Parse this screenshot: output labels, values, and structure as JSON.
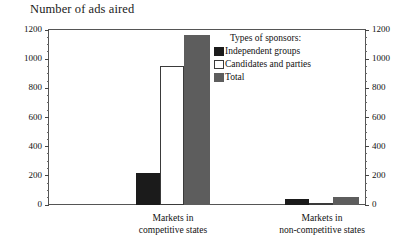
{
  "chart_data": {
    "type": "bar",
    "title": "Number of ads aired",
    "xlabel": "",
    "ylabel": "",
    "ylim": [
      0,
      1200
    ],
    "ytick_step": 200,
    "yticks": [
      0,
      200,
      400,
      600,
      800,
      1000,
      1200
    ],
    "ytick_labels": [
      "0",
      "200",
      "400",
      "600",
      "800",
      "1000",
      "1200"
    ],
    "secondary_axis": {
      "position": "right",
      "ylim": [
        0,
        1200
      ],
      "ytick_labels": [
        "0",
        "200",
        "400",
        "600",
        "800",
        "1000",
        "1200"
      ]
    },
    "grid": false,
    "legend_position": "inside-top-right",
    "legend_title": "Types of sponsors:",
    "categories": [
      "Markets in competitive states",
      "Markets in non-competitive states"
    ],
    "category_lines": [
      [
        "Markets in",
        "competitive states"
      ],
      [
        "Markets in",
        "non-competitive states"
      ]
    ],
    "series": [
      {
        "name": "Independent groups",
        "color": "#1b1b1b",
        "values": [
          220,
          40
        ]
      },
      {
        "name": "Candidates and parties",
        "color": "#ffffff",
        "values": [
          950,
          10
        ]
      },
      {
        "name": "Total",
        "color": "#5d5d5d",
        "values": [
          1165,
          55
        ]
      }
    ]
  },
  "title": "Number of ads aired",
  "legend": {
    "heading": "Types of sponsors:",
    "items": [
      {
        "label": "Independent groups"
      },
      {
        "label": "Candidates and parties"
      },
      {
        "label": "Total"
      }
    ]
  },
  "axis": {
    "left_labels": [
      "1200",
      "1000",
      "800",
      "600",
      "400",
      "200",
      "0"
    ],
    "right_labels": [
      "1200",
      "1000",
      "800",
      "600",
      "400",
      "200",
      "0"
    ]
  },
  "groups": [
    {
      "line1": "Markets in",
      "line2": "competitive states"
    },
    {
      "line1": "Markets in",
      "line2": "non-competitive states"
    }
  ]
}
